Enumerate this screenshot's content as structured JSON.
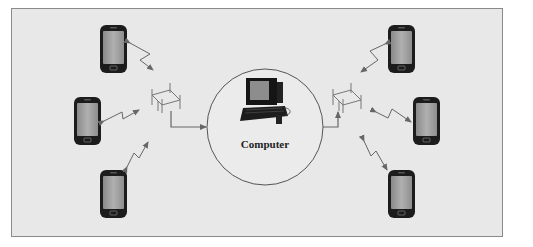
{
  "diagram": {
    "type": "wireless-network",
    "background_color": "#e8e8e8",
    "border_color": "#8a8a8a",
    "arrow_color": "#666666",
    "center": {
      "label": "Computer",
      "icon": "desktop-computer-icon"
    },
    "left_group": {
      "access_point_icon": "antenna-icon",
      "devices": [
        {
          "icon": "smartphone-icon"
        },
        {
          "icon": "smartphone-icon"
        },
        {
          "icon": "smartphone-icon"
        }
      ]
    },
    "right_group": {
      "access_point_icon": "antenna-icon",
      "devices": [
        {
          "icon": "smartphone-icon"
        },
        {
          "icon": "smartphone-icon"
        },
        {
          "icon": "smartphone-icon"
        }
      ]
    },
    "connections": [
      {
        "from": "left-phone-1",
        "to": "left-antenna",
        "type": "wireless-bidirectional"
      },
      {
        "from": "left-phone-2",
        "to": "left-antenna",
        "type": "wireless-bidirectional"
      },
      {
        "from": "left-phone-3",
        "to": "left-antenna",
        "type": "wireless-bidirectional"
      },
      {
        "from": "left-antenna",
        "to": "computer",
        "type": "wired"
      },
      {
        "from": "computer",
        "to": "right-antenna",
        "type": "wired"
      },
      {
        "from": "right-antenna",
        "to": "right-phone-1",
        "type": "wireless-bidirectional"
      },
      {
        "from": "right-antenna",
        "to": "right-phone-2",
        "type": "wireless-bidirectional"
      },
      {
        "from": "right-antenna",
        "to": "right-phone-3",
        "type": "wireless-bidirectional"
      }
    ]
  }
}
